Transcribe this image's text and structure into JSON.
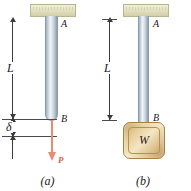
{
  "figure": {
    "background_color": "#ffffff",
    "width": 191,
    "height": 191
  },
  "colors": {
    "rod_metal_light": "#eef3f6",
    "rod_metal_dark": "#8d9daa",
    "support_beige": "#e4e2c4",
    "weight_gold": "#e0c492",
    "force_arrow": "#ea8a72",
    "force_label": "#d0674c",
    "dimension_line": "#3b3b3b",
    "text": "#1a1a1a"
  },
  "panels": [
    {
      "id": "a",
      "caption": "(a)",
      "support_label": "support-block",
      "top_point_label": "A",
      "bottom_point_label": "B",
      "length_label": "L",
      "elongation_label": "δ",
      "force_label": "P",
      "load_type": "applied-force"
    },
    {
      "id": "b",
      "caption": "(b)",
      "support_label": "support-block",
      "top_point_label": "A",
      "bottom_point_label": "B",
      "length_label": "L",
      "weight_label": "W",
      "load_type": "hanging-weight"
    }
  ]
}
